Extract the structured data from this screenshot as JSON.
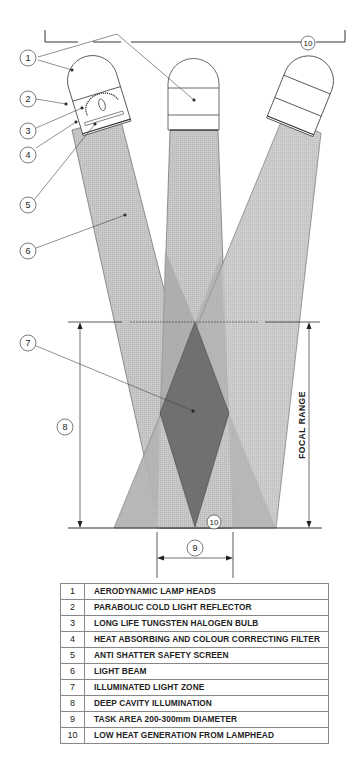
{
  "diagram": {
    "callouts": [
      "1",
      "2",
      "3",
      "4",
      "5",
      "6",
      "7",
      "8",
      "9",
      "10"
    ],
    "focal_range_label": "FOCAL RANGE",
    "colors": {
      "beam": "#c4c4c4",
      "beam_overlap": "#a6a6a6",
      "illuminated_zone": "#6f6f6f",
      "line": "#333333"
    }
  },
  "legend": {
    "rows": [
      {
        "num": "1",
        "text": "AERODYNAMIC LAMP HEADS"
      },
      {
        "num": "2",
        "text": "PARABOLIC COLD LIGHT REFLECTOR"
      },
      {
        "num": "3",
        "text": "LONG LIFE TUNGSTEN HALOGEN BULB"
      },
      {
        "num": "4",
        "text": "HEAT ABSORBING AND COLOUR CORRECTING FILTER"
      },
      {
        "num": "5",
        "text": "ANTI SHATTER SAFETY SCREEN"
      },
      {
        "num": "6",
        "text": "LIGHT BEAM"
      },
      {
        "num": "7",
        "text": "ILLUMINATED LIGHT ZONE"
      },
      {
        "num": "8",
        "text": "DEEP CAVITY ILLUMINATION"
      },
      {
        "num": "9",
        "text": "TASK AREA 200-300mm DIAMETER"
      },
      {
        "num": "10",
        "text": "LOW HEAT GENERATION FROM LAMPHEAD"
      }
    ]
  }
}
